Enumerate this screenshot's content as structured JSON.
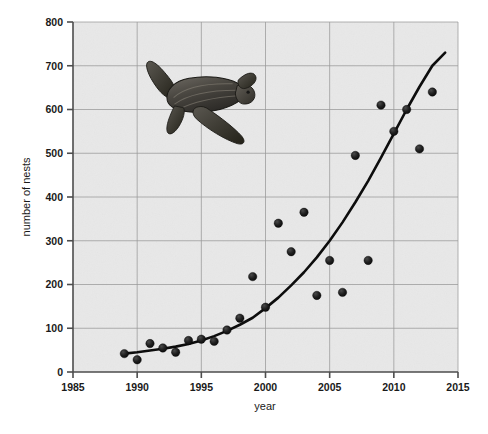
{
  "chart_data": {
    "type": "scatter",
    "title": "",
    "subtitle": "",
    "xlabel": "year",
    "ylabel": "number of nests",
    "xlim": [
      1985,
      2015
    ],
    "ylim": [
      0,
      800
    ],
    "xticks": [
      1985,
      1990,
      1995,
      2000,
      2005,
      2010,
      2015
    ],
    "xtick_labels": [
      "1985",
      "1990",
      "1995",
      "2000",
      "2005",
      "2010",
      "2015"
    ],
    "yticks": [
      0,
      100,
      200,
      300,
      400,
      500,
      600,
      700,
      800
    ],
    "ytick_labels": [
      "0",
      "100",
      "200",
      "300",
      "400",
      "500",
      "600",
      "700",
      "800"
    ],
    "grid": true,
    "grid_axis": "both",
    "legend": false,
    "legend_position": "none",
    "plot_background_color": "#e8e8e8",
    "grid_color": "#9a9a9a",
    "axis_color": "#4d4d4d",
    "marker_color": "#1a1a1a",
    "trend_color": "#000000",
    "marker_size": 4.2,
    "series": [
      {
        "name": "number of nests",
        "kind": "scatter",
        "x": [
          1989,
          1990,
          1991,
          1992,
          1993,
          1994,
          1995,
          1996,
          1997,
          1998,
          1999,
          2000,
          2001,
          2002,
          2003,
          2004,
          2005,
          2006,
          2007,
          2008,
          2009,
          2010,
          2011,
          2012,
          2013
        ],
        "y": [
          42,
          28,
          65,
          55,
          45,
          72,
          75,
          70,
          96,
          123,
          218,
          148,
          340,
          275,
          365,
          175,
          255,
          182,
          495,
          255,
          610,
          550,
          600,
          510,
          640
        ]
      },
      {
        "name": "exponential trend",
        "kind": "line",
        "x": [
          1989,
          1990,
          1991,
          1992,
          1993,
          1994,
          1995,
          1996,
          1997,
          1998,
          1999,
          2000,
          2001,
          2002,
          2003,
          2004,
          2005,
          2006,
          2007,
          2008,
          2009,
          2010,
          2011,
          2012,
          2013,
          2014
        ],
        "y": [
          42,
          45,
          49,
          53,
          58,
          64,
          72,
          82,
          94,
          108,
          124,
          146,
          170,
          198,
          228,
          262,
          300,
          342,
          388,
          437,
          490,
          545,
          600,
          652,
          700,
          730
        ]
      }
    ],
    "annotations": [
      {
        "kind": "image",
        "name": "leatherback-sea-turtle-illustration",
        "x_range": [
          1990.5,
          1999.0
        ],
        "y_range": [
          520,
          730
        ]
      }
    ]
  },
  "axis": {
    "x_title": "year",
    "y_title": "number of nests"
  }
}
